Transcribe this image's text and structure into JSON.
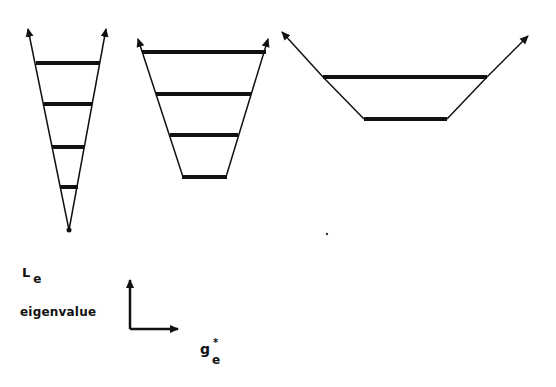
{
  "figure": {
    "colors": {
      "ink": "#111111",
      "background": "#ffffff"
    },
    "diagrams": [
      {
        "name": "narrow-well",
        "levels": 4,
        "apex": "point"
      },
      {
        "name": "medium-well",
        "levels": 4,
        "apex": "flat"
      },
      {
        "name": "wide-well",
        "levels": 2,
        "apex": "flat"
      }
    ],
    "axis_key": {
      "y_label": "L",
      "y_subscript": "e",
      "y_description": "eigenvalue",
      "x_label": "g",
      "x_superscript": "*",
      "x_subscript": "e"
    }
  }
}
